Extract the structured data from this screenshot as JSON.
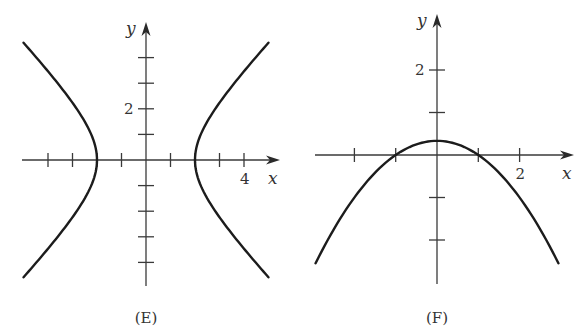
{
  "chart_data": [
    {
      "type": "line",
      "id": "E",
      "caption": "(E)",
      "title": "",
      "xlabel": "x",
      "ylabel": "y",
      "equation": "x^2/4 - y^2/4 = 1",
      "description": "Hyperbola opening left and right with vertices at (-2, 0) and (2, 0)",
      "xlim": [
        -5,
        5.4
      ],
      "ylim": [
        -4.9,
        4.5
      ],
      "x_ticks": [
        -4,
        -3,
        -2,
        -1,
        1,
        2,
        3,
        4
      ],
      "y_ticks": [
        -4,
        -3,
        -2,
        -1,
        1,
        2,
        3,
        4
      ],
      "x_tick_labels": [
        {
          "value": 4,
          "text": "4"
        }
      ],
      "y_tick_labels": [
        {
          "value": 2,
          "text": "2"
        }
      ],
      "series": [
        {
          "name": "right branch",
          "points": [
            [
              5.0,
              4.58
            ],
            [
              4.0,
              3.46
            ],
            [
              3.0,
              2.24
            ],
            [
              2.5,
              1.5
            ],
            [
              2.2,
              0.92
            ],
            [
              2.0,
              0
            ],
            [
              2.2,
              -0.92
            ],
            [
              2.5,
              -1.5
            ],
            [
              3.0,
              -2.24
            ],
            [
              4.0,
              -3.46
            ],
            [
              5.0,
              -4.58
            ]
          ]
        },
        {
          "name": "left branch",
          "points": [
            [
              -5.0,
              4.58
            ],
            [
              -4.0,
              3.46
            ],
            [
              -3.0,
              2.24
            ],
            [
              -2.5,
              1.5
            ],
            [
              -2.2,
              0.92
            ],
            [
              -2.0,
              0
            ],
            [
              -2.2,
              -0.92
            ],
            [
              -2.5,
              -1.5
            ],
            [
              -3.0,
              -2.24
            ],
            [
              -4.0,
              -3.46
            ],
            [
              -5.0,
              -4.58
            ]
          ]
        }
      ],
      "grid": false,
      "legend": null
    },
    {
      "type": "line",
      "id": "F",
      "caption": "(F)",
      "title": "",
      "xlabel": "x",
      "ylabel": "y",
      "equation": "y = (1 - x^2)/3",
      "description": "Downward-opening parabola with vertex at (0, 1/3) and x-intercepts at -1 and 1",
      "xlim": [
        -3,
        3.3
      ],
      "ylim": [
        -3,
        2.7
      ],
      "x_ticks": [
        -2,
        -1,
        1,
        2
      ],
      "y_ticks": [
        -2,
        -1,
        1,
        2
      ],
      "x_tick_labels": [
        {
          "value": 2,
          "text": "2"
        }
      ],
      "y_tick_labels": [
        {
          "value": 2,
          "text": "2"
        }
      ],
      "series": [
        {
          "name": "parabola",
          "points": [
            [
              -2.94,
              -2.55
            ],
            [
              -2.5,
              -1.75
            ],
            [
              -2.0,
              -1.0
            ],
            [
              -1.5,
              -0.42
            ],
            [
              -1.0,
              0
            ],
            [
              -0.5,
              0.25
            ],
            [
              0,
              0.33
            ],
            [
              0.5,
              0.25
            ],
            [
              1.0,
              0
            ],
            [
              1.5,
              -0.42
            ],
            [
              2.0,
              -1.0
            ],
            [
              2.5,
              -1.75
            ],
            [
              2.94,
              -2.55
            ]
          ]
        }
      ],
      "grid": false,
      "legend": null
    }
  ],
  "figures": {
    "E": {
      "caption": "(E)",
      "x_axis_label": "x",
      "y_axis_label": "y",
      "x_tick_label": "4",
      "y_tick_label": "2"
    },
    "F": {
      "caption": "(F)",
      "x_axis_label": "x",
      "y_axis_label": "y",
      "x_tick_label": "2",
      "y_tick_label": "2"
    }
  },
  "layout": {
    "E": {
      "origin": [
        146,
        160
      ],
      "px_per_unit_x": 24.5,
      "px_per_unit_y": 25.6,
      "x_axis_span": [
        22,
        280
      ],
      "y_axis_span": [
        22,
        286
      ]
    },
    "F": {
      "origin": [
        437,
        155
      ],
      "px_per_unit_x": 41.3,
      "px_per_unit_y": 42.5,
      "x_axis_span": [
        315,
        574
      ],
      "y_axis_span": [
        14,
        284
      ]
    }
  }
}
